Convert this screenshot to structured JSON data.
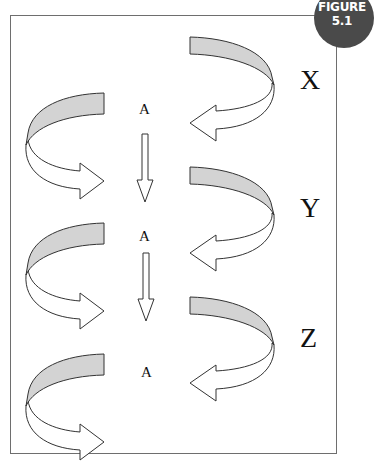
{
  "figure": {
    "badge_line1": "FIGURE",
    "badge_line2": "5.1",
    "badge_color": "#4a4a4a"
  },
  "diagram": {
    "right_labels": [
      "X",
      "Y",
      "Z"
    ],
    "center_labels": [
      "A",
      "A",
      "A"
    ],
    "band_fill": "#d3d3d3",
    "arrow_fill": "#ffffff",
    "stroke": "#333333"
  }
}
